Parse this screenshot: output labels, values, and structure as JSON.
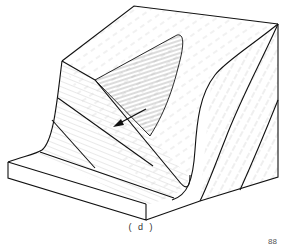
{
  "figure": {
    "caption": "( d )",
    "page_number_partial": "88",
    "colors": {
      "outline": "#111111",
      "hatch": "#9a9a9a",
      "background": "#ffffff"
    },
    "elements": [
      "block-diagram",
      "hatched-slip-surface",
      "movement-arrow",
      "front-slab",
      "right-face-strata"
    ]
  }
}
